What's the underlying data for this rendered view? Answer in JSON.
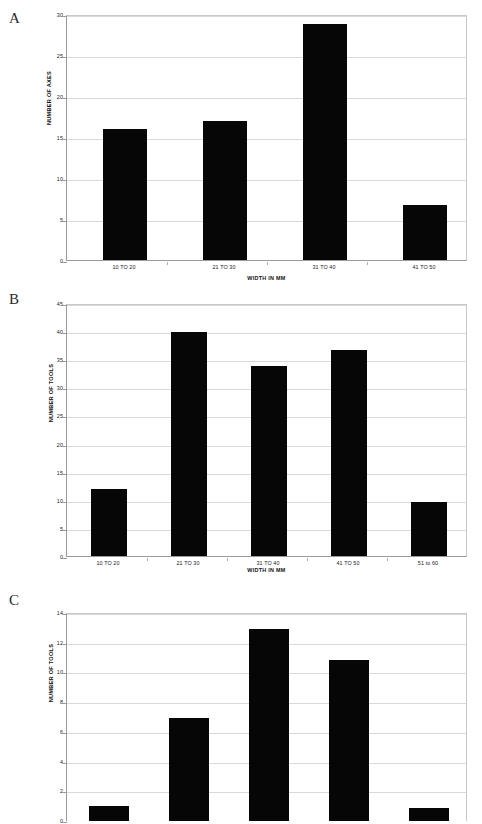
{
  "figure": {
    "panels": [
      {
        "letter": "A",
        "chart_data": {
          "type": "bar",
          "title": "",
          "categories": [
            "10 TO 20",
            "21 TO 30",
            "31 TO 40",
            "41 TO 50"
          ],
          "values": [
            16.0,
            17.0,
            28.8,
            6.7
          ],
          "xlabel": "WIDTH IN MM",
          "ylabel": "NUMBER OF AXES",
          "ylim": [
            0,
            30
          ],
          "yticks": [
            0,
            5,
            10,
            15,
            20,
            25,
            30
          ],
          "grid": true,
          "legend": "none",
          "bar_color": "#060606"
        }
      },
      {
        "letter": "B",
        "chart_data": {
          "type": "bar",
          "title": "",
          "categories": [
            "10 TO 20",
            "21 TO 30",
            "31 TO 40",
            "41 TO 50",
            "51 to 60"
          ],
          "values": [
            12.0,
            39.9,
            33.8,
            36.6,
            9.6
          ],
          "xlabel": "WIDTH IN MM",
          "ylabel": "NUMBER OF TOOLS",
          "ylim": [
            0,
            45
          ],
          "yticks": [
            0,
            5,
            10,
            15,
            20,
            25,
            30,
            35,
            40,
            45
          ],
          "grid": true,
          "legend": "none",
          "bar_color": "#060606"
        }
      },
      {
        "letter": "C",
        "chart_data": {
          "type": "bar",
          "title": "",
          "categories": [
            "",
            "",
            "",
            "",
            ""
          ],
          "values": [
            1.0,
            6.95,
            12.9,
            10.85,
            0.85
          ],
          "xlabel": "",
          "ylabel": "NUMBER OF TOOLS",
          "ylim": [
            0,
            14
          ],
          "yticks": [
            0,
            2,
            4,
            6,
            8,
            10,
            12,
            14
          ],
          "grid": true,
          "legend": "none",
          "bar_color": "#060606",
          "note": "panel cropped at image bottom edge; x axis not visible"
        }
      }
    ]
  }
}
